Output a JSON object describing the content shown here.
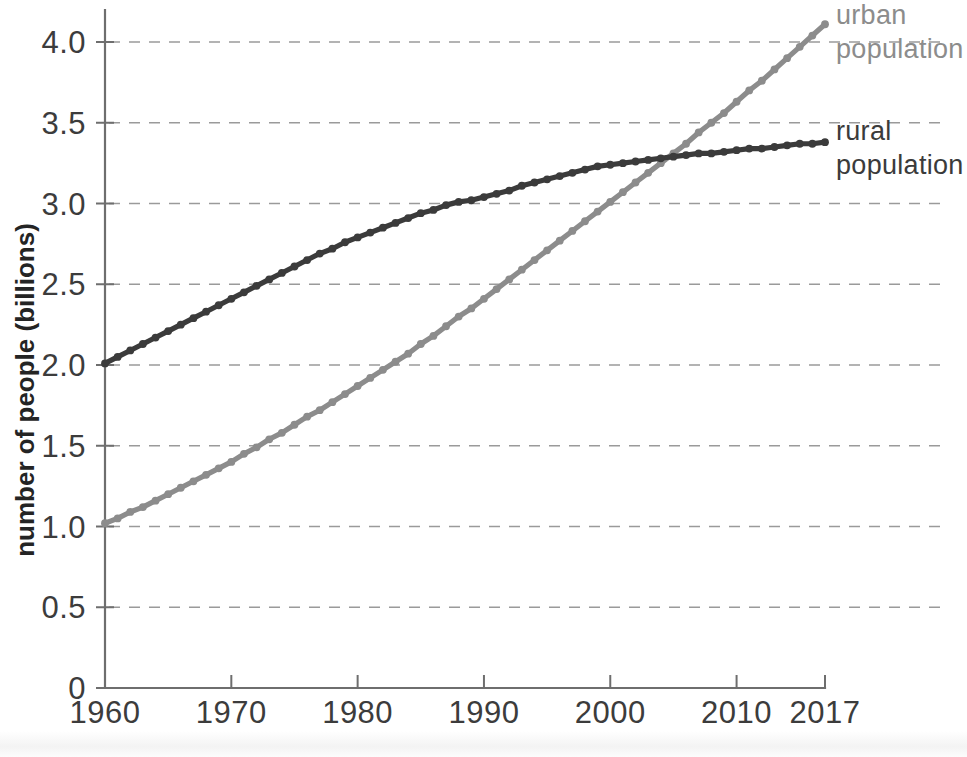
{
  "chart_data": {
    "type": "line",
    "title": "",
    "subtitle": "",
    "xlabel": "",
    "ylabel": "number of people (billions)",
    "xlim": [
      1960,
      2017
    ],
    "ylim": [
      0,
      4.25
    ],
    "grid": "horizontal-dashed",
    "legend_position": "right-inline-labels",
    "x_ticks": [
      "1960",
      "1970",
      "1980",
      "1990",
      "2000",
      "2010",
      "2017"
    ],
    "x_tick_values": [
      1960,
      1970,
      1980,
      1990,
      2000,
      2010,
      2017
    ],
    "y_ticks": [
      "0",
      "0.5",
      "1.0",
      "1.5",
      "2.0",
      "2.5",
      "3.0",
      "3.5",
      "4.0"
    ],
    "y_tick_values": [
      0,
      0.5,
      1.0,
      1.5,
      2.0,
      2.5,
      3.0,
      3.5,
      4.0
    ],
    "x": [
      1960,
      1961,
      1962,
      1963,
      1964,
      1965,
      1966,
      1967,
      1968,
      1969,
      1970,
      1971,
      1972,
      1973,
      1974,
      1975,
      1976,
      1977,
      1978,
      1979,
      1980,
      1981,
      1982,
      1983,
      1984,
      1985,
      1986,
      1987,
      1988,
      1989,
      1990,
      1991,
      1992,
      1993,
      1994,
      1995,
      1996,
      1997,
      1998,
      1999,
      2000,
      2001,
      2002,
      2003,
      2004,
      2005,
      2006,
      2007,
      2008,
      2009,
      2010,
      2011,
      2012,
      2013,
      2014,
      2015,
      2016,
      2017
    ],
    "series": [
      {
        "name": "urban population",
        "label": "urban\npopulation",
        "label_line1": "urban",
        "label_line2": "population",
        "color": "#8c8c8c",
        "marker": "circle",
        "values": [
          1.02,
          1.05,
          1.09,
          1.12,
          1.16,
          1.2,
          1.24,
          1.28,
          1.32,
          1.36,
          1.4,
          1.45,
          1.49,
          1.54,
          1.58,
          1.63,
          1.68,
          1.72,
          1.77,
          1.82,
          1.87,
          1.92,
          1.97,
          2.02,
          2.07,
          2.13,
          2.18,
          2.24,
          2.3,
          2.35,
          2.41,
          2.47,
          2.53,
          2.59,
          2.65,
          2.71,
          2.77,
          2.83,
          2.89,
          2.95,
          3.01,
          3.07,
          3.13,
          3.19,
          3.25,
          3.31,
          3.37,
          3.44,
          3.5,
          3.56,
          3.63,
          3.7,
          3.76,
          3.83,
          3.9,
          3.97,
          4.04,
          4.11
        ]
      },
      {
        "name": "rural population",
        "label": "rural\npopulation",
        "label_line1": "rural",
        "label_line2": "population",
        "color": "#3b3b3b",
        "marker": "circle",
        "values": [
          2.01,
          2.05,
          2.09,
          2.13,
          2.17,
          2.21,
          2.25,
          2.29,
          2.33,
          2.37,
          2.41,
          2.45,
          2.49,
          2.53,
          2.57,
          2.61,
          2.65,
          2.69,
          2.72,
          2.76,
          2.79,
          2.82,
          2.85,
          2.88,
          2.91,
          2.94,
          2.96,
          2.99,
          3.01,
          3.02,
          3.04,
          3.06,
          3.08,
          3.11,
          3.13,
          3.15,
          3.17,
          3.19,
          3.21,
          3.23,
          3.24,
          3.25,
          3.26,
          3.27,
          3.28,
          3.29,
          3.3,
          3.31,
          3.31,
          3.32,
          3.33,
          3.34,
          3.34,
          3.35,
          3.36,
          3.37,
          3.37,
          3.38
        ]
      }
    ],
    "annotations": [
      {
        "text": "crossover of rural and urban population near 2007 at about 3.3 billion"
      }
    ]
  }
}
